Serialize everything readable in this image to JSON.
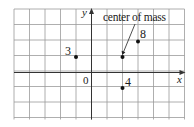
{
  "figure": {
    "grid": {
      "left": 14,
      "top": 9,
      "right": 184.5,
      "bottom": 119.5,
      "cols": 11,
      "rows": 7,
      "cell": 15.5,
      "origin_px": {
        "x": 91.5,
        "y": 72.5
      },
      "line_color": "#9a9a9a",
      "axis_color": "#333333"
    },
    "axes": {
      "x_label": "x",
      "y_label": "y",
      "origin_label": "0"
    },
    "masses": [
      {
        "label": "3",
        "x": -1,
        "y": 1
      },
      {
        "label": "8",
        "x": 3,
        "y": 2
      },
      {
        "label": "4",
        "x": 2,
        "y": -1
      }
    ],
    "center_of_mass": {
      "label": "center of mass",
      "x": 2,
      "y": 1
    }
  }
}
